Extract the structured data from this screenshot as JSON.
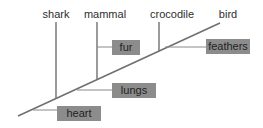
{
  "diagram": {
    "type": "cladogram",
    "line_color": "#707070",
    "box_color": "#8c8c8c",
    "text_color": "#2e2e2e",
    "taxa": [
      {
        "label": "shark",
        "x": 56
      },
      {
        "label": "mammal",
        "x": 97
      },
      {
        "label": "crocodile",
        "x": 159
      },
      {
        "label": "bird",
        "x": 228
      }
    ],
    "traits": [
      {
        "label": "heart",
        "order": 1
      },
      {
        "label": "lungs",
        "order": 2
      },
      {
        "label": "fur",
        "order": 3
      },
      {
        "label": "feathers",
        "order": 4
      }
    ]
  }
}
